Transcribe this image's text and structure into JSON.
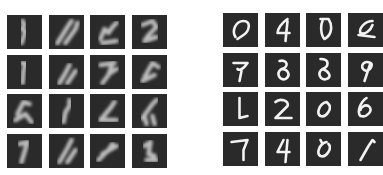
{
  "panels": [
    {
      "name": "generated-samples",
      "rows": 4,
      "cols": 4,
      "tile_color": "#2a2a2a",
      "stroke_color": "#d8d8d8",
      "digits": [
        "3",
        "/",
        "5",
        "2",
        "1",
        "4",
        "7",
        "0",
        "5",
        "2",
        "6",
        "6",
        "7",
        "0",
        "7",
        "5"
      ],
      "paths": [
        "M15 6 L17 10 L14 14 L18 16 L16 22 L14 28",
        "M8 28 L18 12 L22 6 M16 28 L26 14 L28 8",
        "M10 24 L14 14 L18 18 L22 12 L26 8 M12 28 L26 26",
        "M10 10 L20 6 L24 12 L16 20 L12 26 L24 22",
        "M14 8 L18 8 L16 16 L15 28",
        "M10 28 L16 18 L20 10 M18 28 L26 16",
        "M10 10 L24 8 M22 8 L18 20 L12 28 M20 18 L26 14",
        "M12 22 L20 8 L26 12 M10 26 L22 20",
        "M10 20 L16 8 L22 10 M8 26 L18 20 L24 28",
        "M14 28 L16 18 L20 12 L20 6",
        "M10 26 L20 14 L24 8 M10 26 L26 26",
        "M10 24 L20 10 L24 6 M12 22 L14 30 M20 22 L22 30",
        "M12 10 L20 8 M20 8 L14 28",
        "M10 28 L18 14 L22 6 M18 28 L26 16",
        "M8 26 L18 16 L22 10 M12 20 L26 12",
        "M12 12 L18 8 L16 20 L22 22 M14 26 L24 26"
      ]
    },
    {
      "name": "real-samples",
      "rows": 4,
      "cols": 4,
      "tile_color": "#2a2a2a",
      "stroke_color": "#f2f2f2",
      "digits": [
        "0",
        "4",
        "0",
        "0",
        "9",
        "8",
        "8",
        "9",
        "1",
        "2",
        "0",
        "0",
        "7",
        "4",
        "0",
        "1"
      ],
      "paths": [
        "M12 24 C8 18 12 8 20 8 C28 8 26 18 20 22 L14 26",
        "M22 6 C16 10 12 16 12 20 L24 20 M22 8 L20 28",
        "M14 6 L22 6 C26 12 26 22 18 26 C14 22 14 12 16 8",
        "M24 8 C16 8 10 16 12 20 C16 22 22 18 24 12 M10 22 L26 24",
        "M10 10 L24 10 C20 16 16 18 14 16 M18 18 L16 28",
        "M14 8 C22 6 24 14 16 16 C10 20 14 28 20 26 C26 22 22 16 16 16",
        "M14 6 C24 6 22 14 16 16 C10 20 14 28 20 26 C26 24 22 18 16 16",
        "M22 10 C14 6 10 16 18 18 C24 16 24 10 22 10 L16 28",
        "M16 6 L16 26 L24 24",
        "M10 10 C14 6 24 8 22 14 L10 26 L26 26",
        "M20 10 C12 12 10 22 14 24 C20 26 26 16 22 12 Z",
        "M18 6 C12 10 8 20 12 24 C18 26 26 18 20 14 C16 12 12 16 12 18",
        "M8 10 L24 8 L20 18 L20 28",
        "M18 8 L12 20 L24 20 M22 8 L20 30",
        "M20 10 C12 12 10 22 14 24 C20 26 26 16 22 12 M14 8 L16 12",
        "M12 28 L20 14 L24 8 L26 10"
      ]
    }
  ]
}
